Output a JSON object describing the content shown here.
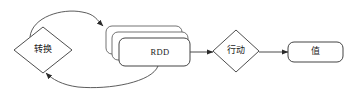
{
  "diagram": {
    "stroke_color": "#3a3a3a",
    "fill_color": "#ffffff",
    "text_color": "#1a1a1a",
    "nodes": [
      {
        "id": "transformation",
        "shape": "diamond",
        "label": "转换"
      },
      {
        "id": "rdd",
        "shape": "stacked-rounded-rect",
        "label": "RDD",
        "stack_count": 3
      },
      {
        "id": "action",
        "shape": "diamond",
        "label": "行动"
      },
      {
        "id": "value",
        "shape": "rounded-rect",
        "label": "值"
      }
    ],
    "edges": [
      {
        "id": "transformation-to-rdd",
        "from": "transformation",
        "to": "rdd",
        "style": "curved",
        "arrow": "to"
      },
      {
        "id": "rdd-to-transformation",
        "from": "rdd",
        "to": "transformation",
        "style": "curved",
        "arrow": "to"
      },
      {
        "id": "rdd-to-action",
        "from": "rdd",
        "to": "action",
        "style": "straight",
        "arrow": "to"
      },
      {
        "id": "action-to-value",
        "from": "action",
        "to": "value",
        "style": "straight",
        "arrow": "to"
      }
    ]
  }
}
